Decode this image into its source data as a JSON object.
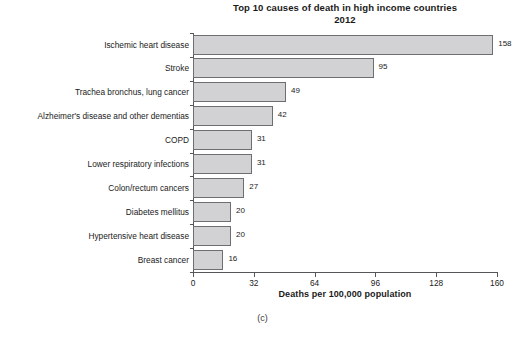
{
  "figure": {
    "caption": "(c)",
    "background_color": "#ffffff"
  },
  "chart_data": {
    "type": "bar",
    "orientation": "horizontal",
    "title": "Top 10 causes of death in high income countries",
    "subtitle": "2012",
    "xlabel": "Deaths per 100,000 population",
    "ylabel": "",
    "xlim": [
      0,
      160
    ],
    "xticks": [
      0,
      32,
      64,
      96,
      128,
      160
    ],
    "xtick_labels": [
      "0",
      "32",
      "64",
      "96",
      "128",
      "160"
    ],
    "grid": false,
    "legend": null,
    "bar_color": "#d2d2d5",
    "bar_edge_color": "#6d6e72",
    "categories": [
      "Ischemic heart disease",
      "Stroke",
      "Trachea bronchus, lung cancer",
      "Alzheimer's disease and other dementias",
      "COPD",
      "Lower respiratory infections",
      "Colon/rectum cancers",
      "Diabetes mellitus",
      "Hypertensive heart disease",
      "Breast cancer"
    ],
    "values": [
      158,
      95,
      49,
      42,
      31,
      31,
      27,
      20,
      20,
      16
    ],
    "value_labels": [
      "158",
      "95",
      "49",
      "42",
      "31",
      "31",
      "27",
      "20",
      "20",
      "16"
    ]
  }
}
